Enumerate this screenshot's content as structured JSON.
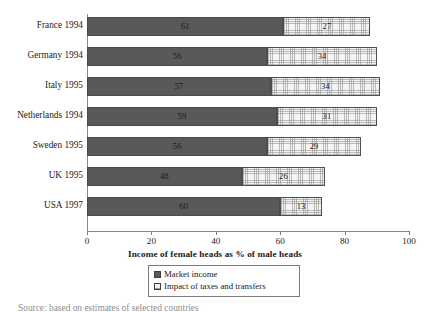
{
  "chart_data": {
    "type": "bar",
    "orientation": "horizontal",
    "stacked": true,
    "title": "",
    "xlabel": "Income of female heads as % of male heads",
    "ylabel": "",
    "xlim": [
      0,
      100
    ],
    "xticks": [
      0,
      20,
      40,
      60,
      80,
      100
    ],
    "grid": false,
    "legend_position": "bottom-center",
    "categories": [
      "France 1994",
      "Germany 1994",
      "Italy 1995",
      "Netherlands 1994",
      "Sweden 1995",
      "UK 1995",
      "USA 1997"
    ],
    "series": [
      {
        "name": "Market income",
        "color": "#595959",
        "values": [
          61,
          56,
          57,
          59,
          56,
          48,
          60
        ]
      },
      {
        "name": "Impact of taxes and transfers",
        "color": "#f4f4f4",
        "values": [
          27,
          34,
          34,
          31,
          29,
          26,
          13
        ]
      }
    ],
    "totals": [
      88,
      90,
      91,
      90,
      85,
      74,
      73
    ]
  },
  "axis": {
    "title": "Income of female heads as % of male heads",
    "tick_labels": [
      "0",
      "20",
      "40",
      "60",
      "80",
      "100"
    ]
  },
  "legend": {
    "items": [
      {
        "label": "Market income",
        "swatch": "solid-dark-gray"
      },
      {
        "label": "Impact of taxes and transfers",
        "swatch": "hatched-light-gray"
      }
    ]
  },
  "caption": {
    "partial_text": "Source: based on estimates of selected countries"
  },
  "colors": {
    "market_income": "#595959",
    "taxes_transfers": "#f4f4f4",
    "axis": "#8a8a8a",
    "text": "#1a1a1a"
  }
}
